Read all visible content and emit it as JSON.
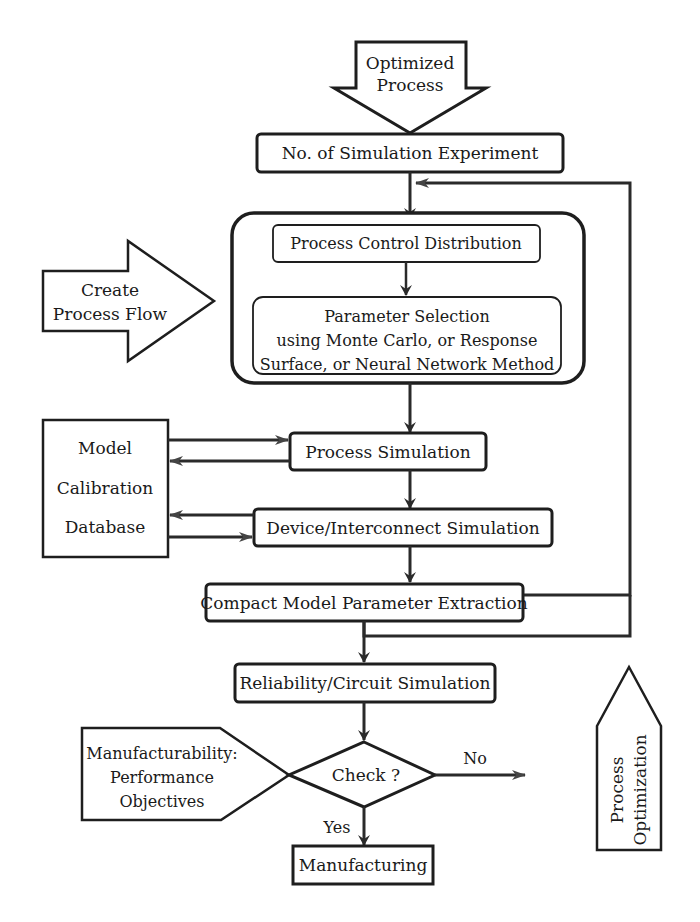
{
  "diagram": {
    "top_arrow": {
      "line1": "Optimized",
      "line2": "Process"
    },
    "boxes": {
      "sim_experiment": "No. of Simulation Experiment",
      "process_control": "Process Control Distribution",
      "param_selection": {
        "line1": "Parameter Selection",
        "line2": "using Monte Carlo, or Response",
        "line3": "Surface, or Neural Network Method"
      },
      "process_simulation": "Process Simulation",
      "device_simulation": "Device/Interconnect Simulation",
      "compact_model": "Compact Model Parameter Extraction",
      "reliability": "Reliability/Circuit Simulation",
      "manufacturing": "Manufacturing"
    },
    "left_arrow": {
      "line1": "Create",
      "line2": "Process Flow"
    },
    "database": {
      "line1": "Model",
      "line2": "Calibration",
      "line3": "Database"
    },
    "objectives": {
      "line1": "Manufacturability:",
      "line2": "Performance",
      "line3": "Objectives"
    },
    "decision": {
      "label": "Check ?",
      "no_label": "No",
      "yes_label": "Yes"
    },
    "optimization": {
      "line1": "Process",
      "line2": "Optimization"
    },
    "colors": {
      "stroke": "#1e1e1e",
      "background": "#ffffff"
    }
  }
}
